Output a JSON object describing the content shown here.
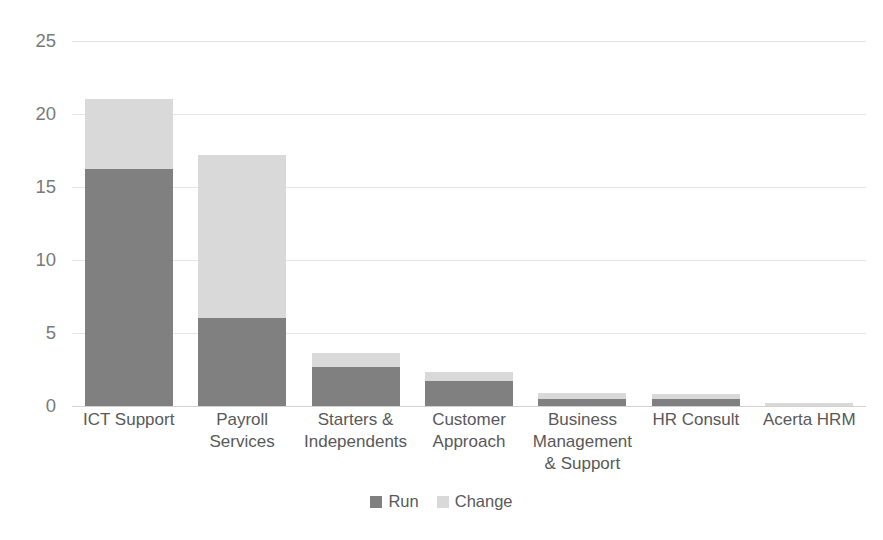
{
  "chart_data": {
    "type": "bar",
    "stacked": true,
    "title": "",
    "subtitle": "",
    "xlabel": "",
    "ylabel": "",
    "ylim": [
      0,
      25
    ],
    "yticks": [
      0,
      5,
      10,
      15,
      20,
      25
    ],
    "ytick_labels": [
      "0",
      "5",
      "10",
      "15",
      "20",
      "25"
    ],
    "grid": true,
    "legend_position": "bottom",
    "categories": [
      "ICT Support",
      "Payroll\nServices",
      "Starters &\nIndependents",
      "Customer\nApproach",
      "Business\nManagement\n& Support",
      "HR Consult",
      "Acerta HRM"
    ],
    "series": [
      {
        "name": "Run",
        "color": "#808080",
        "values": [
          16.2,
          6.0,
          2.7,
          1.7,
          0.5,
          0.45,
          0.0
        ]
      },
      {
        "name": "Change",
        "color": "#d9d9d9",
        "values": [
          4.8,
          11.2,
          0.9,
          0.6,
          0.4,
          0.4,
          0.2
        ]
      }
    ],
    "totals": [
      21.0,
      17.2,
      3.6,
      2.3,
      0.9,
      0.85,
      0.2
    ]
  },
  "legend": {
    "items": [
      {
        "label": "Run",
        "color": "#808080"
      },
      {
        "label": "Change",
        "color": "#d9d9d9"
      }
    ]
  },
  "colors": {
    "run": "#808080",
    "change": "#d9d9d9",
    "gridline": "#e4e4e4",
    "axis_text": "#7a7a7a",
    "category_text": "#595959",
    "background": "#ffffff"
  }
}
